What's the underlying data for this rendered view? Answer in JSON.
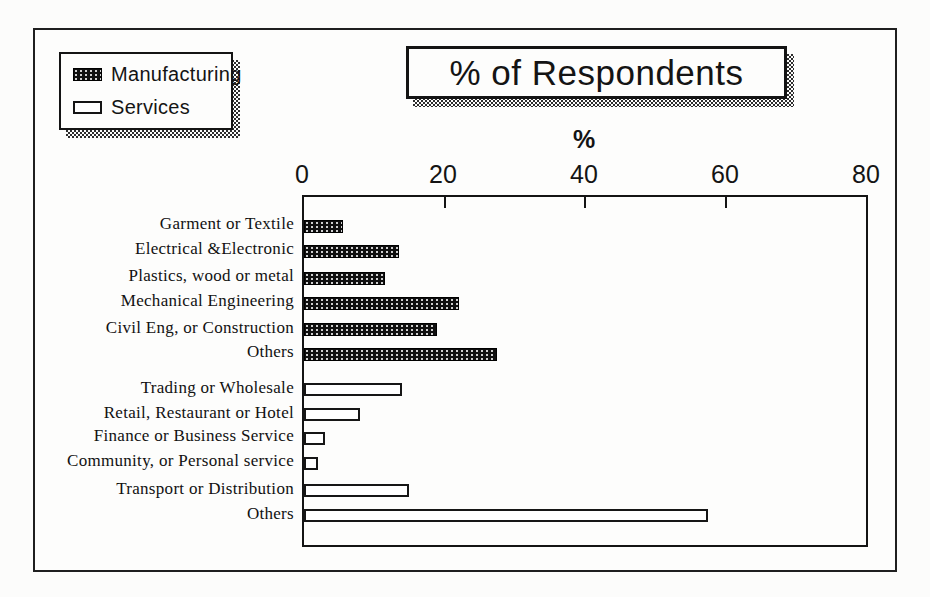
{
  "chart_data": {
    "type": "bar",
    "orientation": "horizontal",
    "title": "% of Respondents",
    "xlabel": "%",
    "xlim": [
      0,
      80
    ],
    "x_ticks": [
      0,
      20,
      40,
      60,
      80
    ],
    "grid": false,
    "legend_position": "top-left",
    "categories": [
      "Garment or Textile",
      "Electrical &Electronic",
      "Plastics, wood or metal",
      "Mechanical Engineering",
      "Civil Eng, or Construction",
      "Others",
      "Trading or Wholesale",
      "Retail, Restaurant or Hotel",
      "Finance or Business Service",
      "Community, or Personal service",
      "Transport or Distribution",
      "Others"
    ],
    "series": [
      {
        "name": "Manufacturing",
        "style": "speckled-black",
        "values": [
          5.5,
          13.5,
          11.5,
          22,
          19,
          27.5,
          null,
          null,
          null,
          null,
          null,
          null
        ]
      },
      {
        "name": "Services",
        "style": "white-outlined",
        "values": [
          null,
          null,
          null,
          null,
          null,
          null,
          14,
          8,
          3,
          2,
          15,
          57.5
        ]
      }
    ]
  },
  "colors": {
    "ink": "#141414",
    "paper": "#fdfdfc",
    "shadow_check": "#2d2d2d"
  }
}
